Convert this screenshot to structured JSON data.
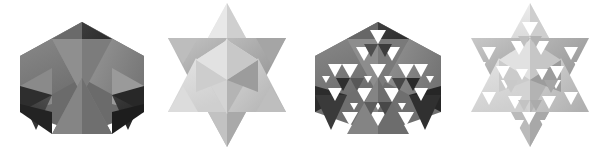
{
  "image": {
    "kind": "photographic-figure-strip",
    "subject": "Four greyscale renderings of stella octangula polyhedra and their fractal (Sierpinski) iterations",
    "background_color": "#ffffff",
    "width": 612,
    "height": 156,
    "panel_count": 4
  },
  "palette": {
    "background": "#ffffff",
    "dark_face_lightest": "#9a9a9a",
    "dark_face_light": "#8a8a8a",
    "dark_face_mid": "#747474",
    "dark_face_dark": "#5a5a5a",
    "dark_face_darkest": "#343434",
    "dark_face_shadow": "#232323",
    "light_face_lightest": "#e6e6e6",
    "light_face_light": "#d8d8d8",
    "light_face_mid": "#c4c4c4",
    "light_face_dark": "#ababab",
    "light_face_darkest": "#949494",
    "hole_color": "#ffffff"
  },
  "panels": [
    {
      "id": "panel-0",
      "name": "dark-hexagonal-compound",
      "caption": "",
      "tone": "dark",
      "silhouette": "hexagon",
      "iteration": 0,
      "description": "Compound of two tetrahedra seen along a three-fold axis, giving a hexagonal outline with a bright central triangle",
      "bounds": {
        "x": 20,
        "y": 22,
        "width": 124,
        "height": 112
      }
    },
    {
      "id": "panel-1",
      "name": "light-star-compound",
      "caption": "",
      "tone": "light",
      "silhouette": "six-pointed-star",
      "iteration": 0,
      "description": "Stella octangula seen along a two-fold axis giving a six pointed star silhouette",
      "bounds": {
        "x": 168,
        "y": 3,
        "width": 118,
        "height": 145
      }
    },
    {
      "id": "panel-2",
      "name": "dark-hexagonal-fractal",
      "caption": "",
      "tone": "dark",
      "silhouette": "hexagon",
      "iteration": 2,
      "description": "Fractal Sierpinski iteration of the hexagonal compound, pierced by many white triangular holes",
      "bounds": {
        "x": 313,
        "y": 22,
        "width": 127,
        "height": 112
      }
    },
    {
      "id": "panel-3",
      "name": "light-star-fractal",
      "caption": "",
      "tone": "light",
      "silhouette": "six-pointed-star",
      "iteration": 2,
      "description": "Fractal Sierpinski iteration of the star compound, pierced by many white triangular holes",
      "bounds": {
        "x": 462,
        "y": 3,
        "width": 118,
        "height": 145
      }
    }
  ]
}
